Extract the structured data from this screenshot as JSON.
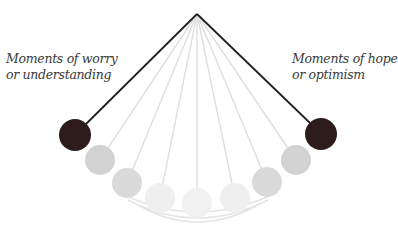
{
  "labels": {
    "left": [
      "Moments of worry",
      "or understanding"
    ],
    "right": [
      "Moments of hope",
      "or optimism"
    ]
  },
  "colors": {
    "dark_ball": "#2e1c1c",
    "string_dark": "#222222",
    "gray_ball": "#d3d3d3",
    "faint_ball": "#ececec",
    "faint_string": "#dcdcdc"
  },
  "pendulum": {
    "pivot": [
      197,
      14
    ],
    "balls": [
      {
        "position": "left-extreme",
        "cx": 75,
        "cy": 135,
        "r": 16,
        "shade": "dark"
      },
      {
        "position": "left-2",
        "cx": 100,
        "cy": 160,
        "r": 15,
        "shade": "gray"
      },
      {
        "position": "left-3",
        "cx": 127,
        "cy": 183,
        "r": 15,
        "shade": "gray"
      },
      {
        "position": "left-4",
        "cx": 160,
        "cy": 198,
        "r": 15,
        "shade": "faint"
      },
      {
        "position": "center",
        "cx": 197,
        "cy": 203,
        "r": 15,
        "shade": "faint"
      },
      {
        "position": "right-4",
        "cx": 235,
        "cy": 198,
        "r": 15,
        "shade": "faint"
      },
      {
        "position": "right-3",
        "cx": 267,
        "cy": 182,
        "r": 15,
        "shade": "gray"
      },
      {
        "position": "right-2",
        "cx": 296,
        "cy": 160,
        "r": 15,
        "shade": "gray"
      },
      {
        "position": "right-extreme",
        "cx": 321,
        "cy": 134,
        "r": 16,
        "shade": "dark"
      }
    ]
  }
}
